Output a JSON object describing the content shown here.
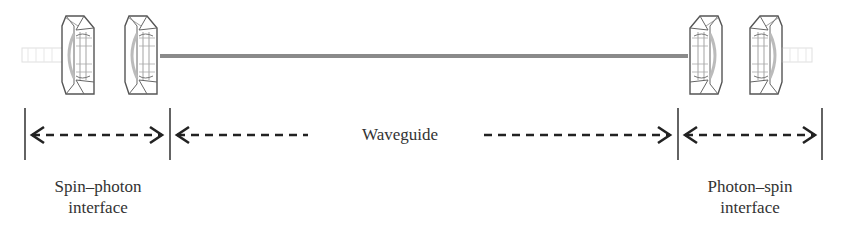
{
  "diagram": {
    "type": "quantum-network-link",
    "waveguide_label": "Waveguide",
    "left_interface": {
      "line1": "Spin–photon",
      "line2": "interface"
    },
    "right_interface": {
      "line1": "Photon–spin",
      "line2": "interface"
    },
    "components": [
      {
        "name": "left-fiber-stub",
        "kind": "fiber"
      },
      {
        "name": "left-cavity-1",
        "kind": "lens"
      },
      {
        "name": "left-cavity-2",
        "kind": "lens"
      },
      {
        "name": "waveguide",
        "kind": "line"
      },
      {
        "name": "right-cavity-1",
        "kind": "lens"
      },
      {
        "name": "right-cavity-2",
        "kind": "lens"
      },
      {
        "name": "right-fiber-stub",
        "kind": "fiber"
      }
    ],
    "colors": {
      "line": "#8a8a8a",
      "ink": "#2a2a2a",
      "faint": "#d8d8d8"
    }
  }
}
